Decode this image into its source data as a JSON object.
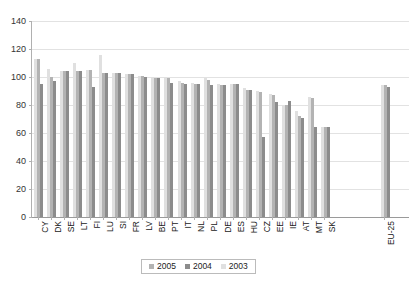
{
  "chart_data": {
    "type": "bar",
    "title": "",
    "xlabel": "",
    "ylabel": "",
    "ylim": [
      0,
      140
    ],
    "yticks": [
      0,
      20,
      40,
      60,
      80,
      100,
      120,
      140
    ],
    "grid": true,
    "legend_position": "bottom-center",
    "categories": [
      "CY",
      "DK",
      "SE",
      "LT",
      "FI",
      "LU",
      "SI",
      "FR",
      "LV",
      "BE",
      "PT",
      "IT",
      "NL",
      "PL",
      "DE",
      "ES",
      "HU",
      "CZ",
      "EE",
      "IE",
      "AT",
      "MT",
      "SK",
      "",
      "EU-25"
    ],
    "series": [
      {
        "name": "2005",
        "color": "#b3b3b3",
        "values": [
          113,
          105,
          104,
          103,
          105,
          103,
          103,
          102,
          99,
          96,
          95,
          98,
          94,
          95,
          null,
          null,
          null,
          null,
          null,
          null,
          null,
          null,
          null,
          null,
          94
        ]
      },
      {
        "name": "2004",
        "color": "#8c8c8c",
        "values": [
          95,
          97,
          104,
          104,
          105,
          103,
          103,
          102,
          99,
          96,
          95,
          98,
          94,
          95,
          104,
          103,
          100,
          87,
          78,
          83,
          72,
          84,
          64,
          null,
          93
        ]
      },
      {
        "name": "2003",
        "color": "#e0e0e0",
        "values": [
          null,
          106,
          null,
          110,
          null,
          116,
          null,
          null,
          null,
          100,
          null,
          null,
          null,
          null,
          null,
          92,
          null,
          57,
          null,
          80,
          null,
          86,
          null,
          null,
          null
        ]
      }
    ],
    "groups": [
      {
        "label": "CY",
        "bars": [
          {
            "series": "2003",
            "value": 113
          },
          {
            "series": "2005",
            "value": 113
          },
          {
            "series": "2004",
            "value": 95
          }
        ]
      },
      {
        "label": "DK",
        "bars": [
          {
            "series": "2003",
            "value": 106
          },
          {
            "series": "2005",
            "value": 100
          },
          {
            "series": "2004",
            "value": 97
          }
        ]
      },
      {
        "label": "SE",
        "bars": [
          {
            "series": "2003",
            "value": 104
          },
          {
            "series": "2005",
            "value": 104
          },
          {
            "series": "2004",
            "value": 104
          }
        ]
      },
      {
        "label": "LT",
        "bars": [
          {
            "series": "2003",
            "value": 110
          },
          {
            "series": "2005",
            "value": 104
          },
          {
            "series": "2004",
            "value": 104
          }
        ]
      },
      {
        "label": "FI",
        "bars": [
          {
            "series": "2003",
            "value": 105
          },
          {
            "series": "2005",
            "value": 105
          },
          {
            "series": "2004",
            "value": 93
          }
        ]
      },
      {
        "label": "LU",
        "bars": [
          {
            "series": "2003",
            "value": 116
          },
          {
            "series": "2005",
            "value": 103
          },
          {
            "series": "2004",
            "value": 103
          }
        ]
      },
      {
        "label": "SI",
        "bars": [
          {
            "series": "2003",
            "value": 103
          },
          {
            "series": "2005",
            "value": 103
          },
          {
            "series": "2004",
            "value": 103
          }
        ]
      },
      {
        "label": "FR",
        "bars": [
          {
            "series": "2003",
            "value": 102
          },
          {
            "series": "2005",
            "value": 102
          },
          {
            "series": "2004",
            "value": 102
          }
        ]
      },
      {
        "label": "LV",
        "bars": [
          {
            "series": "2003",
            "value": 101
          },
          {
            "series": "2005",
            "value": 101
          },
          {
            "series": "2004",
            "value": 100
          }
        ]
      },
      {
        "label": "BE",
        "bars": [
          {
            "series": "2003",
            "value": 100
          },
          {
            "series": "2005",
            "value": 99
          },
          {
            "series": "2004",
            "value": 99
          }
        ]
      },
      {
        "label": "PT",
        "bars": [
          {
            "series": "2003",
            "value": 100
          },
          {
            "series": "2005",
            "value": 99
          },
          {
            "series": "2004",
            "value": 96
          }
        ]
      },
      {
        "label": "IT",
        "bars": [
          {
            "series": "2003",
            "value": 97
          },
          {
            "series": "2005",
            "value": 96
          },
          {
            "series": "2004",
            "value": 95
          }
        ]
      },
      {
        "label": "NL",
        "bars": [
          {
            "series": "2003",
            "value": 96
          },
          {
            "series": "2005",
            "value": 95
          },
          {
            "series": "2004",
            "value": 95
          }
        ]
      },
      {
        "label": "PL",
        "bars": [
          {
            "series": "2003",
            "value": 99
          },
          {
            "series": "2005",
            "value": 98
          },
          {
            "series": "2004",
            "value": 94
          }
        ]
      },
      {
        "label": "DE",
        "bars": [
          {
            "series": "2003",
            "value": 95
          },
          {
            "series": "2005",
            "value": 94
          },
          {
            "series": "2004",
            "value": 94
          }
        ]
      },
      {
        "label": "ES",
        "bars": [
          {
            "series": "2003",
            "value": 95
          },
          {
            "series": "2005",
            "value": 95
          },
          {
            "series": "2004",
            "value": 95
          }
        ]
      },
      {
        "label": "HU",
        "bars": [
          {
            "series": "2003",
            "value": 92
          },
          {
            "series": "2005",
            "value": 91
          },
          {
            "series": "2004",
            "value": 91
          }
        ]
      },
      {
        "label": "CZ",
        "bars": [
          {
            "series": "2003",
            "value": 90
          },
          {
            "series": "2005",
            "value": 89
          },
          {
            "series": "2004",
            "value": 57
          }
        ]
      },
      {
        "label": "EE",
        "bars": [
          {
            "series": "2003",
            "value": 88
          },
          {
            "series": "2005",
            "value": 87
          },
          {
            "series": "2004",
            "value": 82
          }
        ]
      },
      {
        "label": "IE",
        "bars": [
          {
            "series": "2003",
            "value": 80
          },
          {
            "series": "2005",
            "value": 80
          },
          {
            "series": "2004",
            "value": 83
          }
        ]
      },
      {
        "label": "AT",
        "bars": [
          {
            "series": "2003",
            "value": 76
          },
          {
            "series": "2005",
            "value": 72
          },
          {
            "series": "2004",
            "value": 71
          }
        ]
      },
      {
        "label": "MT",
        "bars": [
          {
            "series": "2003",
            "value": 86
          },
          {
            "series": "2005",
            "value": 85
          },
          {
            "series": "2004",
            "value": 64
          }
        ]
      },
      {
        "label": "SK",
        "bars": [
          {
            "series": "2003",
            "value": 64
          },
          {
            "series": "2005",
            "value": 64
          },
          {
            "series": "2004",
            "value": 64
          }
        ]
      },
      {
        "label": "EU-25",
        "bars": [
          {
            "series": "2003",
            "value": 94
          },
          {
            "series": "2005",
            "value": 94
          },
          {
            "series": "2004",
            "value": 93
          }
        ]
      }
    ],
    "legend": [
      {
        "label": "2005",
        "color": "#b3b3b3"
      },
      {
        "label": "2004",
        "color": "#8c8c8c"
      },
      {
        "label": "2003",
        "color": "#e0e0e0"
      }
    ]
  }
}
